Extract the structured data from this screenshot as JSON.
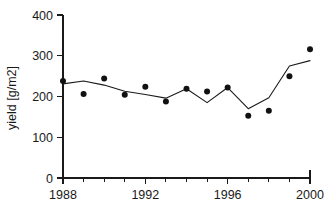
{
  "chart_data": {
    "type": "scatter",
    "title": "",
    "subtitle": "",
    "xlabel": "",
    "ylabel": "yield [g/m2]",
    "x": [
      1988,
      1989,
      1990,
      1991,
      1992,
      1993,
      1994,
      1995,
      1996,
      1997,
      1998,
      1999,
      2000
    ],
    "xlim": [
      1988,
      2000
    ],
    "ylim": [
      0,
      400
    ],
    "grid": false,
    "legend": "none",
    "x_ticks_major": [
      1988,
      1992,
      1996,
      2000
    ],
    "x_tick_labels": [
      "1988",
      "1992",
      "1996",
      "2000"
    ],
    "x_ticks_minor": [
      1989,
      1990,
      1991,
      1993,
      1994,
      1995,
      1997,
      1998,
      1999
    ],
    "y_ticks": [
      0,
      100,
      200,
      300,
      400
    ],
    "y_tick_labels": [
      "0",
      "100",
      "200",
      "300",
      "400"
    ],
    "series": [
      {
        "name": "observed yield",
        "marker": "filled-circle",
        "style": "points",
        "color": "#111111",
        "values": [
          238,
          206,
          244,
          204,
          224,
          188,
          219,
          212,
          222,
          153,
          165,
          250,
          316
        ]
      },
      {
        "name": "modelled yield",
        "marker": "none",
        "style": "line",
        "color": "#1a1a1a",
        "values": [
          231,
          238,
          228,
          213,
          205,
          196,
          219,
          185,
          222,
          170,
          197,
          275,
          288
        ]
      }
    ]
  },
  "axes": {
    "y_axis_title": "yield [g/m2]"
  }
}
